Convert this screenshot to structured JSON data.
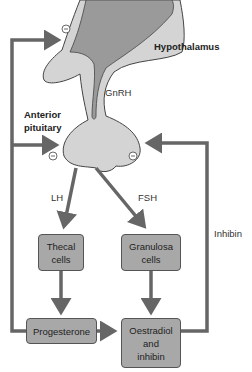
{
  "diagram": {
    "type": "hormonal feedback flowchart",
    "labels": {
      "hypothalamus": "Hypothalamus",
      "gnrh": "GnRH",
      "anterior_pituitary_line1": "Anterior",
      "anterior_pituitary_line2": "pituitary",
      "lh": "LH",
      "fsh": "FSH",
      "inhibin": "Inhibin"
    },
    "boxes": {
      "thecal_line1": "Thecal",
      "thecal_line2": "cells",
      "granulosa_line1": "Granulosa",
      "granulosa_line2": "cells",
      "progesterone": "Progesterone",
      "oestradiol_line1": "Oestradiol",
      "oestradiol_line2": "and",
      "oestradiol_line3": "inhibin"
    },
    "feedback_symbol": "−",
    "colors": {
      "arrow": "#666666",
      "box_fill": "#a8a8a8",
      "hypothalamus_fill": "#9a9a9a",
      "pituitary_fill": "#d0d0d0"
    }
  }
}
